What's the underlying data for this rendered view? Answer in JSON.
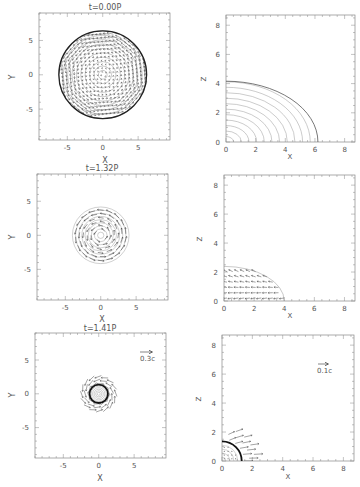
{
  "chart_data": [
    {
      "type": "scatter",
      "panel": "top-left",
      "title": "t=0.00P",
      "xlabel": "X",
      "ylabel": "Y",
      "xlim": [
        -9,
        9.5
      ],
      "ylim": [
        -9.5,
        9
      ],
      "xticks": [
        "-5",
        "0",
        "5"
      ],
      "yticks": [
        "5",
        "0",
        "-5"
      ],
      "description": "Velocity vector field on a disk of radius ~6 (rigid rotation grid)",
      "radius": 6.2
    },
    {
      "type": "line",
      "panel": "top-right",
      "title": "",
      "xlabel": "X",
      "ylabel": "Z",
      "xlim": [
        0,
        8.7
      ],
      "ylim": [
        0,
        8.7
      ],
      "xticks": [
        "0",
        "2",
        "4",
        "6",
        "8"
      ],
      "yticks": [
        "0",
        "2",
        "4",
        "6",
        "8"
      ],
      "description": "Density contours, oblate quarter-ellipses",
      "outer_semi_axes": {
        "x": 6.2,
        "z": 4.1
      }
    },
    {
      "type": "scatter",
      "panel": "middle-left",
      "title": "t=1.32P",
      "xlabel": "X",
      "ylabel": "Y",
      "xlim": [
        -9,
        9.5
      ],
      "ylim": [
        -9.5,
        9
      ],
      "xticks": [
        "-5",
        "0",
        "5"
      ],
      "yticks": [
        "5",
        "0",
        "-5"
      ],
      "description": "Rotating velocity field, radius ~4",
      "radius": 4.0
    },
    {
      "type": "scatter",
      "panel": "middle-right",
      "title": "",
      "xlabel": "X",
      "ylabel": "Z",
      "xlim": [
        0,
        8.7
      ],
      "ylim": [
        0,
        8.7
      ],
      "xticks": [
        "0",
        "2",
        "4",
        "6",
        "8"
      ],
      "yticks": [
        "0",
        "2",
        "4",
        "6",
        "8"
      ],
      "description": "Meridional velocity field, extent x~4, z~2.3",
      "outer_semi_axes": {
        "x": 4.0,
        "z": 2.3
      }
    },
    {
      "type": "scatter",
      "panel": "bottom-left",
      "title": "t=1.41P",
      "xlabel": "X",
      "ylabel": "Y",
      "xlim": [
        -9,
        9.5
      ],
      "ylim": [
        -9.5,
        9
      ],
      "xticks": [
        "-5",
        "0",
        "5"
      ],
      "yticks": [
        "5",
        "0",
        "-5"
      ],
      "description": "Collapsed core with dense ring at r~1.3 and swirling outflow to r~3",
      "reference_vector": "0.3c",
      "radius": 3.0
    },
    {
      "type": "scatter",
      "panel": "bottom-right",
      "title": "",
      "xlabel": "X",
      "ylabel": "Z",
      "xlim": [
        0,
        8.7
      ],
      "ylim": [
        0,
        8.7
      ],
      "xticks": [
        "0",
        "2",
        "4",
        "6",
        "8"
      ],
      "yticks": [
        "0",
        "2",
        "4",
        "6",
        "8"
      ],
      "description": "Core with bold boundary at r~1.3 and outflow vectors along equator",
      "reference_vector": "0.1c",
      "outer_semi_axes": {
        "x": 1.3,
        "z": 1.3
      }
    }
  ],
  "labels": {
    "t0": "t=0.00P",
    "t1": "t=1.32P",
    "t2": "t=1.41P",
    "x": "X",
    "y": "Y",
    "z": "Z",
    "ref_left": "0.3c",
    "ref_right": "0.1c",
    "tick_m5": "-5",
    "tick_0": "0",
    "tick_5": "5",
    "tick_2": "2",
    "tick_4": "4",
    "tick_6": "6",
    "tick_8": "8"
  }
}
